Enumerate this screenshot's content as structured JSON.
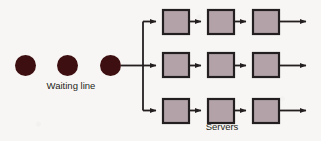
{
  "diagram": {
    "background_color": "#f8f6f4",
    "labels": {
      "waiting_line": "Waiting line",
      "servers": "Servers"
    },
    "customers": {
      "shape": "circle",
      "color": "#3d0f10",
      "count": 3,
      "radius": 10.5,
      "centers": [
        {
          "cx": 25.5,
          "cy": 65.5
        },
        {
          "cx": 67.5,
          "cy": 65.5
        },
        {
          "cx": 110.5,
          "cy": 65.5
        }
      ]
    },
    "flow": {
      "line_color": "#231f20",
      "line_width": 1.8,
      "feed_from_x": 121,
      "feed_to_x": 143,
      "feed_y": 65.5,
      "branch_x": 143,
      "branch_top_y": 21.5,
      "branch_bottom_y": 110.5
    },
    "servers": {
      "fill_color": "#b3a3a8",
      "stroke_color": "#231f20",
      "stroke_width": 2.2,
      "box_width": 26,
      "box_height": 24,
      "columns_x": [
        163,
        208,
        253
      ],
      "rows_y": [
        10,
        53,
        99
      ],
      "rows": [
        {
          "row": 1,
          "phases": 3
        },
        {
          "row": 2,
          "phases": 3
        },
        {
          "row": 3,
          "phases": 3
        }
      ],
      "exit_arrow_end_x": 313
    },
    "label_positions": {
      "waiting_line": {
        "x": 71,
        "y": 89,
        "anchor": "middle"
      },
      "servers": {
        "x": 222,
        "y": 130,
        "anchor": "middle"
      }
    }
  }
}
